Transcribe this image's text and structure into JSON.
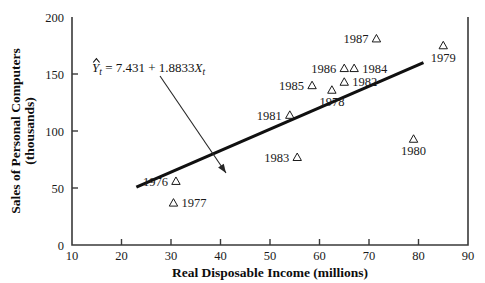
{
  "chart_data": {
    "type": "scatter",
    "title": "",
    "xlabel": "Real Disposable Income (millions)",
    "ylabel_line1": "Sales of Personal Computers",
    "ylabel_line2": "(thousands)",
    "xlim": [
      10,
      90
    ],
    "ylim": [
      0,
      200
    ],
    "xticks": [
      10,
      20,
      30,
      40,
      50,
      60,
      70,
      80,
      90
    ],
    "yticks": [
      0,
      50,
      100,
      150,
      200
    ],
    "xticklabels": [
      "10",
      "20",
      "30",
      "40",
      "50",
      "60",
      "70",
      "80",
      "90"
    ],
    "yticklabels": [
      "0",
      "50",
      "100",
      "150",
      "200"
    ],
    "grid": false,
    "legend": false,
    "marker": "open-triangle",
    "points": [
      {
        "label": "1976",
        "x": 31.0,
        "y": 56.0,
        "label_side": "left"
      },
      {
        "label": "1977",
        "x": 30.5,
        "y": 37.0,
        "label_side": "right"
      },
      {
        "label": "1978",
        "x": 62.5,
        "y": 136.0,
        "label_side": "below"
      },
      {
        "label": "1979",
        "x": 85.0,
        "y": 175.0,
        "label_side": "below"
      },
      {
        "label": "1980",
        "x": 79.0,
        "y": 93.0,
        "label_side": "below"
      },
      {
        "label": "1981",
        "x": 54.0,
        "y": 114.0,
        "label_side": "left"
      },
      {
        "label": "1982",
        "x": 65.0,
        "y": 143.0,
        "label_side": "right"
      },
      {
        "label": "1983",
        "x": 55.5,
        "y": 77.0,
        "label_side": "left"
      },
      {
        "label": "1984",
        "x": 67.0,
        "y": 155.0,
        "label_side": "right"
      },
      {
        "label": "1985",
        "x": 58.5,
        "y": 140.0,
        "label_side": "left"
      },
      {
        "label": "1986",
        "x": 65.0,
        "y": 155.0,
        "label_side": "left"
      },
      {
        "label": "1987",
        "x": 71.5,
        "y": 181.0,
        "label_side": "left"
      }
    ],
    "regression": {
      "equation_display": "= 7.431 + 1.8833",
      "response_symbol": "Y",
      "predictor_symbol": "X",
      "subscript": "t",
      "intercept": 7.431,
      "slope": 1.8833,
      "x_start": 23.0,
      "x_end": 81.0
    },
    "annotation": {
      "text_x": 40,
      "text_y": 168,
      "arrow_from_x": 29.6,
      "arrow_from_y": 158,
      "arrow_to_x": 40.5,
      "arrow_to_y": 70
    },
    "colors": {
      "line": "#101010",
      "axis": "#3a3a3a",
      "marker": "#1a1a1a",
      "text": "#1a1a1a",
      "background": "#ffffff"
    }
  }
}
